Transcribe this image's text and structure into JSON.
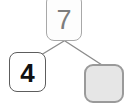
{
  "diagram": {
    "type": "number-bond-tree",
    "background_color": "#ffffff",
    "edge_color": "#8c8c8c",
    "nodes": {
      "root": {
        "value": "7",
        "role": "total",
        "filled": true,
        "border_color": "#a8a8a8",
        "text_color": "#7d7d7d",
        "fill_color": "#ffffff"
      },
      "left_child": {
        "value": "4",
        "role": "part",
        "filled": true,
        "border_color": "#5d5d5d",
        "text_color": "#111111",
        "fill_color": "#ffffff"
      },
      "right_child": {
        "value": "",
        "role": "part-blank",
        "filled": false,
        "border_color": "#9a9a9a",
        "text_color": "#4a4a4a",
        "fill_color": "#e6e6e6"
      }
    },
    "edges": [
      {
        "from": "root",
        "to": "left_child"
      },
      {
        "from": "root",
        "to": "right_child"
      }
    ]
  }
}
